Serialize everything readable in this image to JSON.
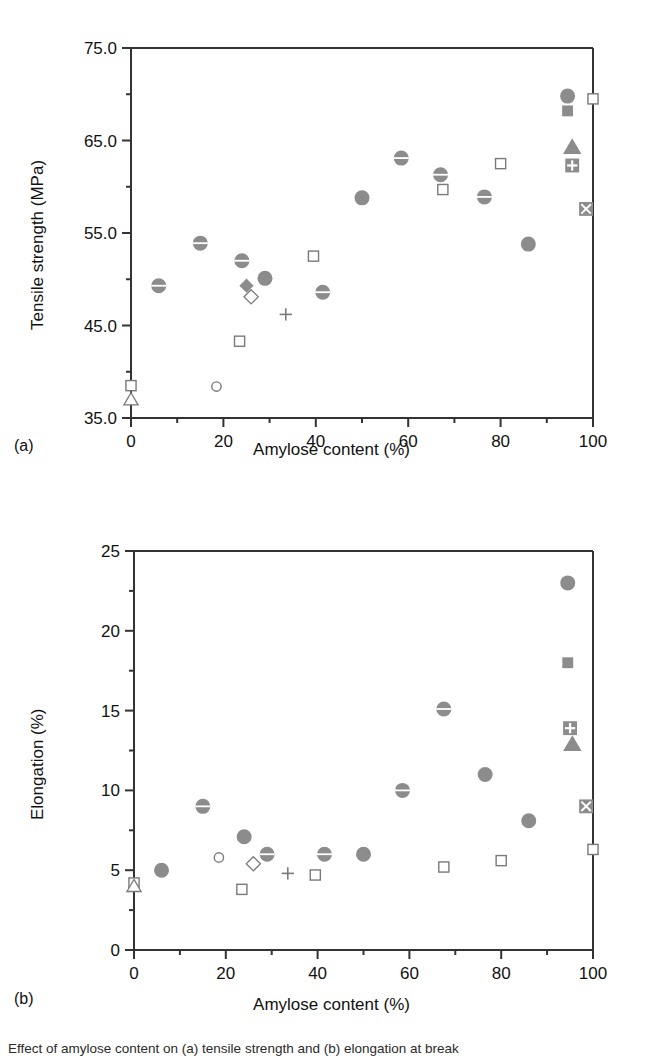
{
  "figure": {
    "panel_a_label": "(a)",
    "panel_b_label": "(b)",
    "caption": "Effect of amylose content on (a) tensile strength and (b) elongation at break"
  },
  "chart_data": [
    {
      "type": "scatter",
      "panel": "(a)",
      "title": "",
      "xlabel": "Amylose content (%)",
      "ylabel": "Tensile strength (MPa)",
      "xlim": [
        0,
        100
      ],
      "ylim": [
        35.0,
        75.0
      ],
      "xticks": [
        0,
        20,
        40,
        60,
        80,
        100
      ],
      "xticklabels": [
        "0",
        "20",
        "40",
        "60",
        "80",
        "100"
      ],
      "xminorticks": [
        10,
        30,
        50,
        70,
        90
      ],
      "yticks": [
        35.0,
        45.0,
        55.0,
        65.0,
        75.0
      ],
      "yticklabels": [
        "35.0",
        "45.0",
        "55.0",
        "65.0",
        "75.0"
      ],
      "yminorticks": [
        40.0,
        50.0,
        60.0,
        70.0
      ],
      "grid": false,
      "legend": "none",
      "points": [
        {
          "x": 0.0,
          "y": 38.5,
          "marker": "open-square"
        },
        {
          "x": 0.0,
          "y": 37.0,
          "marker": "open-triangle"
        },
        {
          "x": 6.0,
          "y": 49.3,
          "marker": "circle-bar"
        },
        {
          "x": 15.0,
          "y": 53.9,
          "marker": "circle-bar"
        },
        {
          "x": 18.5,
          "y": 38.4,
          "marker": "open-circle"
        },
        {
          "x": 23.5,
          "y": 43.3,
          "marker": "open-square"
        },
        {
          "x": 24.0,
          "y": 52.0,
          "marker": "circle-bar"
        },
        {
          "x": 25.0,
          "y": 49.3,
          "marker": "filled-diamond"
        },
        {
          "x": 26.0,
          "y": 48.1,
          "marker": "open-diamond"
        },
        {
          "x": 29.0,
          "y": 50.1,
          "marker": "filled-circle"
        },
        {
          "x": 33.5,
          "y": 46.2,
          "marker": "plus"
        },
        {
          "x": 39.5,
          "y": 52.5,
          "marker": "open-square"
        },
        {
          "x": 41.5,
          "y": 48.6,
          "marker": "circle-bar"
        },
        {
          "x": 50.0,
          "y": 58.8,
          "marker": "filled-circle"
        },
        {
          "x": 58.5,
          "y": 63.1,
          "marker": "circle-bar"
        },
        {
          "x": 67.0,
          "y": 61.3,
          "marker": "circle-bar"
        },
        {
          "x": 67.5,
          "y": 59.7,
          "marker": "open-square"
        },
        {
          "x": 76.5,
          "y": 58.9,
          "marker": "circle-bar"
        },
        {
          "x": 80.0,
          "y": 62.5,
          "marker": "open-square"
        },
        {
          "x": 86.0,
          "y": 53.8,
          "marker": "filled-circle"
        },
        {
          "x": 94.5,
          "y": 69.8,
          "marker": "filled-circle"
        },
        {
          "x": 94.5,
          "y": 68.2,
          "marker": "filled-square"
        },
        {
          "x": 95.5,
          "y": 64.3,
          "marker": "filled-triangle"
        },
        {
          "x": 95.5,
          "y": 62.3,
          "marker": "square-plus"
        },
        {
          "x": 98.5,
          "y": 57.6,
          "marker": "square-cross"
        },
        {
          "x": 100.0,
          "y": 69.5,
          "marker": "open-square"
        }
      ]
    },
    {
      "type": "scatter",
      "panel": "(b)",
      "title": "",
      "xlabel": "Amylose content (%)",
      "ylabel": "Elongation (%)",
      "xlim": [
        0,
        100
      ],
      "ylim": [
        0,
        25
      ],
      "xticks": [
        0,
        20,
        40,
        60,
        80,
        100
      ],
      "xticklabels": [
        "0",
        "20",
        "40",
        "60",
        "80",
        "100"
      ],
      "xminorticks": [
        10,
        30,
        50,
        70,
        90
      ],
      "yticks": [
        0,
        5,
        10,
        15,
        20,
        25
      ],
      "yticklabels": [
        "0",
        "5",
        "10",
        "15",
        "20",
        "25"
      ],
      "yminorticks": [
        2.5,
        7.5,
        12.5,
        17.5,
        22.5
      ],
      "grid": false,
      "legend": "none",
      "points": [
        {
          "x": 0.0,
          "y": 4.2,
          "marker": "open-square"
        },
        {
          "x": 0.0,
          "y": 4.0,
          "marker": "open-triangle"
        },
        {
          "x": 6.0,
          "y": 5.0,
          "marker": "filled-circle"
        },
        {
          "x": 15.0,
          "y": 9.0,
          "marker": "circle-bar"
        },
        {
          "x": 18.5,
          "y": 5.8,
          "marker": "open-circle"
        },
        {
          "x": 23.5,
          "y": 3.8,
          "marker": "open-square"
        },
        {
          "x": 24.0,
          "y": 7.1,
          "marker": "filled-circle"
        },
        {
          "x": 26.0,
          "y": 5.4,
          "marker": "open-diamond"
        },
        {
          "x": 29.0,
          "y": 6.0,
          "marker": "circle-bar"
        },
        {
          "x": 33.5,
          "y": 4.8,
          "marker": "plus"
        },
        {
          "x": 39.5,
          "y": 4.7,
          "marker": "open-square"
        },
        {
          "x": 41.5,
          "y": 6.0,
          "marker": "circle-bar"
        },
        {
          "x": 50.0,
          "y": 6.0,
          "marker": "filled-circle"
        },
        {
          "x": 58.5,
          "y": 10.0,
          "marker": "circle-bar"
        },
        {
          "x": 67.5,
          "y": 15.1,
          "marker": "circle-bar"
        },
        {
          "x": 67.5,
          "y": 5.2,
          "marker": "open-square"
        },
        {
          "x": 76.5,
          "y": 11.0,
          "marker": "filled-circle"
        },
        {
          "x": 80.0,
          "y": 5.6,
          "marker": "open-square"
        },
        {
          "x": 86.0,
          "y": 8.1,
          "marker": "filled-circle"
        },
        {
          "x": 94.5,
          "y": 23.0,
          "marker": "filled-circle"
        },
        {
          "x": 94.5,
          "y": 18.0,
          "marker": "filled-square"
        },
        {
          "x": 95.0,
          "y": 13.9,
          "marker": "square-plus"
        },
        {
          "x": 95.5,
          "y": 12.9,
          "marker": "filled-triangle"
        },
        {
          "x": 98.5,
          "y": 9.0,
          "marker": "square-cross"
        },
        {
          "x": 100.0,
          "y": 6.3,
          "marker": "open-square"
        }
      ]
    }
  ],
  "colors": {
    "marker_fill": "#8c8c8c",
    "marker_edge": "#7a7a7a",
    "axis": "#333333",
    "text": "#111111"
  }
}
